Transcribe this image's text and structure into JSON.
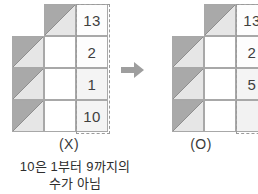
{
  "figure": {
    "title_hidden": "",
    "arrow_icon": "right-arrow-icon",
    "left_panel": {
      "caption": "(X)",
      "columns": 3,
      "rows": 4,
      "cells": [
        {
          "row": 1,
          "col": 1,
          "type": "blank"
        },
        {
          "row": 1,
          "col": 2,
          "type": "triangle"
        },
        {
          "row": 1,
          "col": 3,
          "type": "triangle-number",
          "value": "13"
        },
        {
          "row": 2,
          "col": 1,
          "type": "triangle"
        },
        {
          "row": 2,
          "col": 2,
          "type": "white"
        },
        {
          "row": 2,
          "col": 3,
          "type": "number",
          "value": "2"
        },
        {
          "row": 3,
          "col": 1,
          "type": "triangle"
        },
        {
          "row": 3,
          "col": 2,
          "type": "white"
        },
        {
          "row": 3,
          "col": 3,
          "type": "number",
          "value": "1"
        },
        {
          "row": 4,
          "col": 1,
          "type": "triangle"
        },
        {
          "row": 4,
          "col": 2,
          "type": "white"
        },
        {
          "row": 4,
          "col": 3,
          "type": "number",
          "value": "10"
        }
      ],
      "values": [
        "13",
        "2",
        "1",
        "10"
      ]
    },
    "right_panel": {
      "caption": "(O)",
      "columns": 3,
      "rows": 4,
      "cells": [
        {
          "row": 1,
          "col": 1,
          "type": "blank"
        },
        {
          "row": 1,
          "col": 2,
          "type": "triangle"
        },
        {
          "row": 1,
          "col": 3,
          "type": "triangle-number",
          "value": "13"
        },
        {
          "row": 2,
          "col": 1,
          "type": "triangle"
        },
        {
          "row": 2,
          "col": 2,
          "type": "white"
        },
        {
          "row": 2,
          "col": 3,
          "type": "number",
          "value": "2"
        },
        {
          "row": 3,
          "col": 1,
          "type": "triangle"
        },
        {
          "row": 3,
          "col": 2,
          "type": "white"
        },
        {
          "row": 3,
          "col": 3,
          "type": "number",
          "value": "5"
        },
        {
          "row": 4,
          "col": 1,
          "type": "triangle"
        },
        {
          "row": 4,
          "col": 2,
          "type": "white"
        },
        {
          "row": 4,
          "col": 3,
          "type": "number",
          "value": ""
        }
      ],
      "values": [
        "13",
        "2",
        "5",
        ""
      ]
    },
    "note": {
      "line1": "10은 1부터 9까지의",
      "line2": "수가 아님"
    },
    "colors": {
      "triangle_dark": "#a9a9a9",
      "triangle_light": "#e6e6e6",
      "cell_border": "#a8a8a8",
      "dashed_border": "#9a9a9a",
      "arrow": "#9e9e9e",
      "text": "#3a3a3a"
    }
  }
}
